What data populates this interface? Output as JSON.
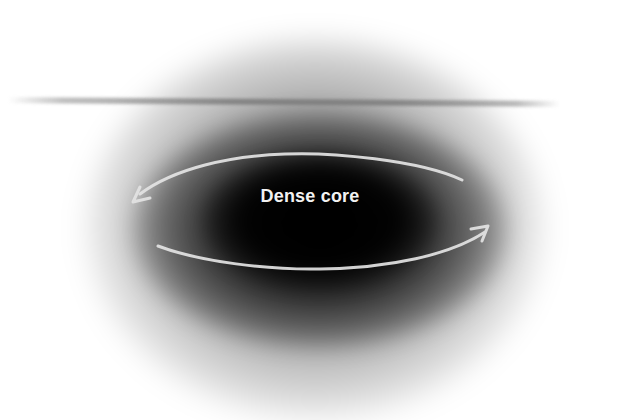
{
  "diagram": {
    "type": "illustration",
    "labels": {
      "core": "Dense core"
    },
    "elements": {
      "cloud": {
        "color": "#000000",
        "style": "radial-blur"
      },
      "horizontal_line": {
        "color": "#7a7a7a"
      },
      "rotation_arrow": {
        "color": "#e6e6e6",
        "direction": "counterclockwise-ellipse",
        "icon": "rotation-arrow-icon"
      }
    }
  }
}
